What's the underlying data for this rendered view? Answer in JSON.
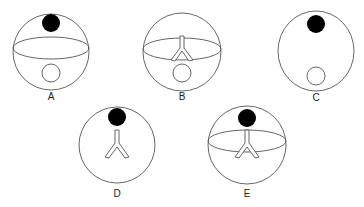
{
  "figures": [
    {
      "label": "A",
      "cx": 51,
      "cy": 52,
      "rx": 38,
      "ry": 38,
      "black_dot": true,
      "equator": true,
      "y_shape": false,
      "white_circle": true
    },
    {
      "label": "B",
      "cx": 182,
      "cy": 52,
      "rx": 39,
      "ry": 39,
      "black_dot": false,
      "equator": true,
      "y_shape": true,
      "white_circle": true
    },
    {
      "label": "C",
      "cx": 316,
      "cy": 51,
      "rx": 38,
      "ry": 40,
      "black_dot": true,
      "equator": false,
      "y_shape": false,
      "white_circle": true
    },
    {
      "label": "D",
      "cx": 117,
      "cy": 145,
      "rx": 38,
      "ry": 38,
      "black_dot": true,
      "equator": false,
      "y_shape": true,
      "white_circle": false
    },
    {
      "label": "E",
      "cx": 247,
      "cy": 145,
      "rx": 39,
      "ry": 38,
      "black_dot": true,
      "equator": true,
      "y_shape": true,
      "white_circle": false
    }
  ],
  "colors": {
    "stroke": "#555555",
    "fill_dark": "#000000",
    "background": "#ffffff"
  }
}
